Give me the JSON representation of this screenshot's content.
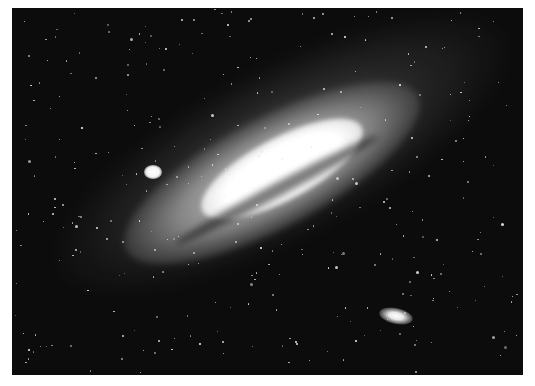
{
  "image": {
    "subject": "Andromeda Galaxy with two satellite galaxies",
    "style": "black-and-white astrophotograph",
    "border_color": "#ffffff",
    "sky_color": "#0c0c0c",
    "core_color": "#ffffff",
    "features": [
      {
        "name": "andromeda-galaxy",
        "shape": "elongated spiral, tilted ~28° rising to the right"
      },
      {
        "name": "satellite-galaxy-upper-left",
        "shape": "small round bright blob"
      },
      {
        "name": "satellite-galaxy-lower-right",
        "shape": "small elliptical blob"
      }
    ],
    "star_count": 320
  }
}
